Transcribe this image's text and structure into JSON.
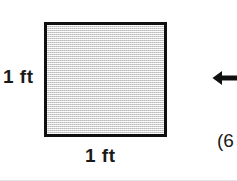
{
  "figure": {
    "kind": "geometry-diagram",
    "background_color": "#ffffff",
    "square": {
      "border_color": "#101010",
      "fill_color": "#e9e9e9",
      "fill_style": "dithered-halftone-gray"
    },
    "labels": {
      "left_side": "1 ft",
      "bottom_side": "1 ft"
    },
    "arrow": {
      "icon": "arrow-left-icon",
      "direction": "left",
      "color": "#101010"
    },
    "clipped_text": "(6"
  }
}
